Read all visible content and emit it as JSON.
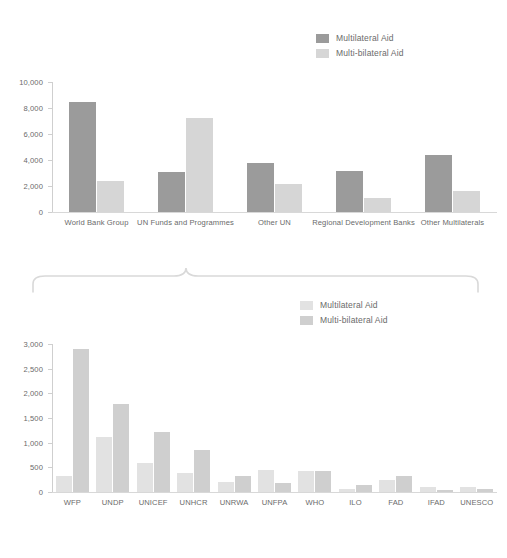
{
  "chart_data": [
    {
      "id": "top",
      "type": "bar",
      "title": "",
      "xlabel": "",
      "ylabel": "",
      "ylim": [
        0,
        10000
      ],
      "yticks": [
        "0",
        "2,000",
        "4,000",
        "6,000",
        "8,000",
        "10,000"
      ],
      "ytick_values": [
        0,
        2000,
        4000,
        6000,
        8000,
        10000
      ],
      "grid": false,
      "legend_position": "top-right",
      "categories": [
        "World Bank Group",
        "UN Funds and Programmes",
        "Other UN",
        "Regional Development Banks",
        "Other Multilaterals"
      ],
      "series": [
        {
          "name": "Multilateral Aid",
          "color": "#9b9b9b",
          "values": [
            8500,
            3100,
            3750,
            3150,
            4350
          ]
        },
        {
          "name": "Multi-bilateral Aid",
          "color": "#d6d6d6",
          "values": [
            2400,
            7200,
            2150,
            1100,
            1650
          ]
        }
      ]
    },
    {
      "id": "bottom",
      "type": "bar",
      "title": "",
      "xlabel": "",
      "ylabel": "",
      "ylim": [
        0,
        3000
      ],
      "yticks": [
        "0",
        "500",
        "1,000",
        "1,500",
        "2,000",
        "2,500",
        "3,000"
      ],
      "ytick_values": [
        0,
        500,
        1000,
        1500,
        2000,
        2500,
        3000
      ],
      "grid": false,
      "legend_position": "top-right",
      "categories": [
        "WFP",
        "UNDP",
        "UNICEF",
        "UNHCR",
        "UNRWA",
        "UNFPA",
        "WHO",
        "ILO",
        "FAD",
        "IFAD",
        "UNESCO"
      ],
      "series": [
        {
          "name": "Multilateral Aid",
          "color": "#e2e2e2",
          "values": [
            320,
            1120,
            590,
            390,
            200,
            450,
            420,
            60,
            240,
            110,
            110
          ]
        },
        {
          "name": "Multi-bilateral Aid",
          "color": "#cfcfcf",
          "values": [
            2900,
            1780,
            1220,
            860,
            320,
            180,
            430,
            150,
            320,
            50,
            70
          ]
        }
      ]
    }
  ],
  "top_chart": {
    "legend": [
      {
        "label": "Multilateral Aid",
        "color": "#9b9b9b"
      },
      {
        "label": "Multi-bilateral Aid",
        "color": "#d6d6d6"
      }
    ]
  },
  "bottom_chart": {
    "legend": [
      {
        "label": "Multilateral Aid",
        "color": "#e2e2e2"
      },
      {
        "label": "Multi-bilateral Aid",
        "color": "#cfcfcf"
      }
    ]
  },
  "connector": {
    "name": "curly-brace",
    "color": "#d9d9d9"
  }
}
